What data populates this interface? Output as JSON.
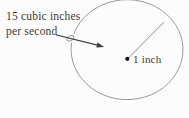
{
  "figure": {
    "labels": {
      "rate_line1": "15 cubic inches",
      "rate_line2": "per second",
      "radius_label": "1 inch"
    },
    "colors": {
      "background": "#fcfcfc",
      "outline": "#9b9b9b",
      "radius_line": "#8f8f8f",
      "arrow": "#3c3c3c",
      "dot": "#161616",
      "text": "#3d3a38"
    }
  }
}
